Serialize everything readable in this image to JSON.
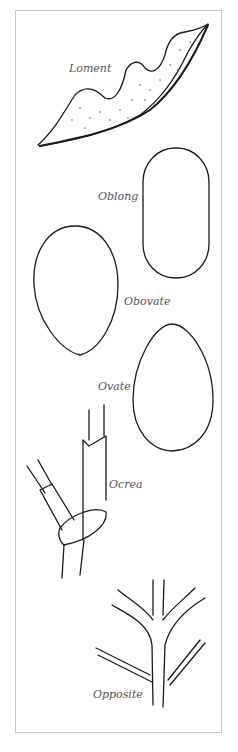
{
  "figure": {
    "type": "botanical glossary illustration",
    "labels": {
      "loment": "Loment",
      "oblong": "Oblong",
      "obovate": "Obovate",
      "ovate": "Ovate",
      "ocrea": "Ocrea",
      "opposite": "Opposite"
    },
    "colors": {
      "ink": "#1a1a1a",
      "label": "#555555",
      "frame": "#c8c8c8",
      "background": "#ffffff"
    }
  }
}
